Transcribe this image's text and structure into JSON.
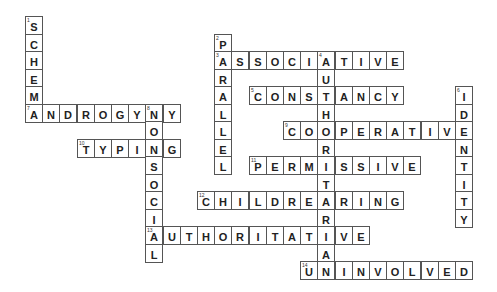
{
  "puzzle": {
    "grid": {
      "origin_x": 25,
      "origin_y": 16,
      "cell_w": 17.2,
      "cell_h": 17.5
    },
    "words": [
      {
        "number": 1,
        "direction": "down",
        "answer": "SCHEMA",
        "col": 0,
        "row": 0
      },
      {
        "number": 2,
        "direction": "down",
        "answer": "PARALLEL",
        "col": 11,
        "row": 1
      },
      {
        "number": 3,
        "direction": "across",
        "answer": "ASSOCIATIVE",
        "col": 11,
        "row": 2
      },
      {
        "number": 4,
        "direction": "down",
        "answer": "AUTHORITARIAN",
        "col": 17,
        "row": 2
      },
      {
        "number": 5,
        "direction": "across",
        "answer": "CONSTANCY",
        "col": 13,
        "row": 4
      },
      {
        "number": 6,
        "direction": "down",
        "answer": "IDENTITY",
        "col": 25,
        "row": 4
      },
      {
        "number": 7,
        "direction": "across",
        "answer": "ANDROGYNY",
        "col": 0,
        "row": 5
      },
      {
        "number": 8,
        "direction": "down",
        "answer": "NONSOCIAL",
        "col": 7,
        "row": 5
      },
      {
        "number": 9,
        "direction": "across",
        "answer": "COOPERATIVE",
        "col": 15,
        "row": 6
      },
      {
        "number": 10,
        "direction": "across",
        "answer": "TYPING",
        "col": 3,
        "row": 7
      },
      {
        "number": 11,
        "direction": "across",
        "answer": "PERMISSIVE",
        "col": 13,
        "row": 8
      },
      {
        "number": 12,
        "direction": "across",
        "answer": "CHILDREARING",
        "col": 10,
        "row": 10
      },
      {
        "number": 13,
        "direction": "across",
        "answer": "AUTHORITATIVE",
        "col": 7,
        "row": 12
      },
      {
        "number": 14,
        "direction": "across",
        "answer": "UNINVOLVED",
        "col": 16,
        "row": 14
      }
    ]
  }
}
